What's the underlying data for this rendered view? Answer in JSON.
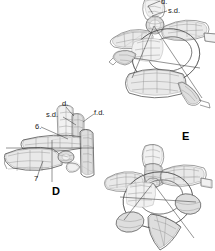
{
  "plate": {
    "title": "Anatomical wireframe plate",
    "background_color": "#ffffff",
    "ink_color": "#4a4a4a",
    "label_color": "#1a1a1a",
    "width": 215,
    "height": 251
  },
  "panels": [
    {
      "id": "top-right-vertebra",
      "panel_label": "",
      "description": "Wireframe vertebra, oblique dorsolateral view",
      "labels": [
        {
          "name": "d",
          "text": "d.",
          "x": 161,
          "y": 0
        },
        {
          "name": "sd",
          "text": "s.d.",
          "x": 168,
          "y": 8
        }
      ]
    },
    {
      "id": "middle-left-vertebra",
      "panel_label": "D",
      "panel_label_x": 52,
      "panel_label_y": 186,
      "description": "Wireframe vertebra, lateral view with elongate process",
      "labels": [
        {
          "name": "d",
          "text": "d.",
          "x": 62,
          "y": 102
        },
        {
          "name": "sd",
          "text": "s.d.",
          "x": 47,
          "y": 112
        },
        {
          "name": "fd",
          "text": "f.d.",
          "x": 95,
          "y": 110
        },
        {
          "name": "six",
          "text": "6.",
          "x": 36,
          "y": 125
        },
        {
          "name": "seven",
          "text": "7",
          "x": 35,
          "y": 176
        }
      ]
    },
    {
      "id": "bottom-right-vertebra",
      "panel_label": "E",
      "panel_label_x": 182,
      "panel_label_y": 132,
      "description": "Wireframe vertebra, oblique ventrolateral view",
      "labels": []
    }
  ],
  "legend_keys": [
    {
      "key": "d.",
      "meaning": "d."
    },
    {
      "key": "s.d.",
      "meaning": "s.d."
    },
    {
      "key": "f.d.",
      "meaning": "f.d."
    },
    {
      "key": "6.",
      "meaning": "6."
    },
    {
      "key": "7",
      "meaning": "7"
    }
  ]
}
